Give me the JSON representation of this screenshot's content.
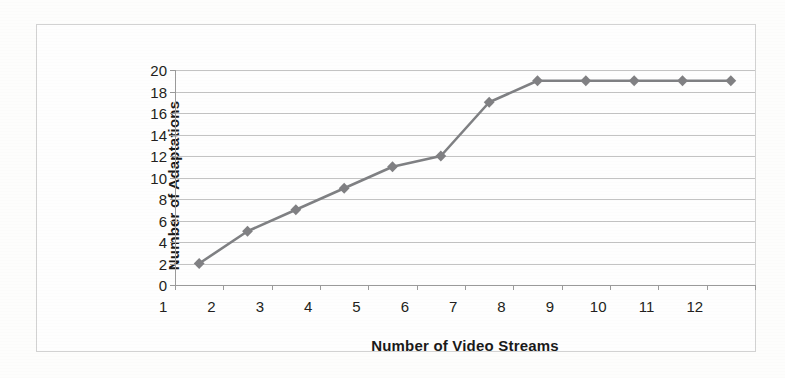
{
  "chart_data": {
    "type": "line",
    "title": "",
    "xlabel": "Number of Video Streams",
    "ylabel": "Number of Adaptations",
    "categories": [
      1,
      2,
      3,
      4,
      5,
      6,
      7,
      8,
      9,
      10,
      11,
      12
    ],
    "x_tick_labels": [
      "1",
      "2",
      "3",
      "4",
      "5",
      "6",
      "7",
      "8",
      "9",
      "10",
      "11",
      "12"
    ],
    "values": [
      2,
      5,
      7,
      9,
      11,
      12,
      17,
      19,
      19,
      19,
      19,
      19
    ],
    "series": [
      {
        "name": "",
        "values": [
          2,
          5,
          7,
          9,
          11,
          12,
          17,
          19,
          19,
          19,
          19,
          19
        ]
      }
    ],
    "ylim": [
      0,
      20
    ],
    "y_tick_labels": [
      "20",
      "18",
      "16",
      "14",
      "12",
      "10",
      "8",
      "6",
      "4",
      "2",
      "0"
    ],
    "y_ticks": [
      0,
      2,
      4,
      6,
      8,
      10,
      12,
      14,
      16,
      18,
      20
    ],
    "y_tick_step": 2,
    "grid": true,
    "grid_axis": "y",
    "legend": false,
    "legend_position": "none",
    "marker": "diamond",
    "colors": {
      "line": "#7f8083",
      "marker": "#808083",
      "gridline": "#b9b9b9",
      "axis": "#9a9a9a",
      "text": "#231f20",
      "frame": "#d2d2d2",
      "background": "#fefefe"
    }
  }
}
